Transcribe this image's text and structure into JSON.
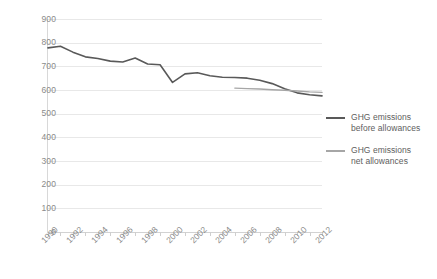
{
  "chart_data": {
    "type": "line",
    "title": "",
    "xlabel": "",
    "ylabel": "",
    "ylim": [
      0,
      900
    ],
    "xlim": [
      1990,
      2012
    ],
    "grid": true,
    "legend_position": "right",
    "y_ticks": [
      900,
      800,
      700,
      600,
      500,
      400,
      300,
      200,
      100,
      0
    ],
    "x_ticks": [
      1990,
      1991,
      1992,
      1993,
      1994,
      1995,
      1996,
      1997,
      1998,
      1999,
      2000,
      2001,
      2002,
      2003,
      2004,
      2005,
      2006,
      2007,
      2008,
      2009,
      2010,
      2011,
      2012
    ],
    "x_tick_labels": [
      "1990",
      "1992",
      "1994",
      "1996",
      "1998",
      "2000",
      "2002",
      "2004",
      "2006",
      "2008",
      "2010",
      "2012"
    ],
    "x": [
      1990,
      1991,
      1992,
      1993,
      1994,
      1995,
      1996,
      1997,
      1998,
      1999,
      2000,
      2001,
      2002,
      2003,
      2004,
      2005,
      2006,
      2007,
      2008,
      2009,
      2010,
      2011,
      2012
    ],
    "series": [
      {
        "name": "GHG emissions before allowances",
        "color": "#595959",
        "x": [
          1990,
          1991,
          1992,
          1993,
          1994,
          1995,
          1996,
          1997,
          1998,
          1999,
          2000,
          2001,
          2002,
          2003,
          2004,
          2005,
          2006,
          2007,
          2008,
          2009,
          2010,
          2011,
          2012
        ],
        "values": [
          778,
          785,
          760,
          740,
          733,
          722,
          718,
          735,
          710,
          707,
          632,
          668,
          673,
          660,
          654,
          653,
          650,
          641,
          627,
          605,
          588,
          580,
          575
        ]
      },
      {
        "name": "GHG emissions net allowances",
        "color": "#a6a6a6",
        "x": [
          2005,
          2006,
          2007,
          2008,
          2009,
          2010,
          2011,
          2012
        ],
        "values": [
          608,
          606,
          604,
          601,
          599,
          596,
          592,
          590
        ]
      }
    ]
  },
  "legend": {
    "entries": [
      {
        "line1": "GHG emissions",
        "line2": "before allowances"
      },
      {
        "line1": "GHG emissions",
        "line2": "net allowances"
      }
    ]
  }
}
